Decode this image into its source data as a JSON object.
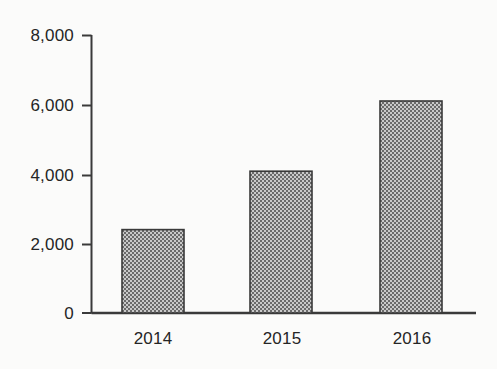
{
  "chart_data": {
    "type": "bar",
    "title": "",
    "subtitle": "",
    "xlabel": "",
    "ylabel": "",
    "categories": [
      "2014",
      "2015",
      "2016"
    ],
    "values": [
      2400,
      4080,
      6100
    ],
    "series": [
      {
        "name": "",
        "values": [
          2400,
          4080,
          6100
        ]
      }
    ],
    "ylim": [
      0,
      8000
    ],
    "yticks": [
      0,
      2000,
      4000,
      6000,
      8000
    ],
    "ytick_labels": [
      "0",
      "2,000",
      "4,000",
      "6,000",
      "8,000"
    ],
    "grid": false,
    "legend": false,
    "legend_position": "none",
    "annotations": [],
    "colors": {
      "bar_fill": "#969696",
      "bar_edge": "#3a3a3a",
      "axis": "#3a3a3a",
      "text": "#252525",
      "background": "#fbfbfa"
    }
  },
  "axis": {
    "y_tick_0": "0",
    "y_tick_1": "2,000",
    "y_tick_2": "4,000",
    "y_tick_3": "6,000",
    "y_tick_4": "8,000",
    "x_tick_0": "2014",
    "x_tick_1": "2015",
    "x_tick_2": "2016"
  }
}
